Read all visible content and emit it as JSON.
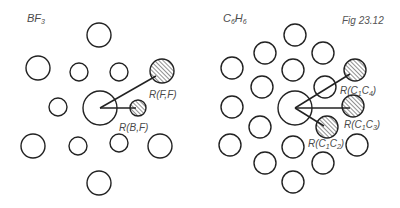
{
  "figure": {
    "label": "Fig 23.12",
    "stroke_color": "#222222",
    "hatch_color": "#333333"
  },
  "panels": [
    {
      "id": "bf3",
      "title_main": "BF",
      "title_sub": "3",
      "center": {
        "x": 100,
        "y": 108,
        "r": 17
      },
      "atoms": [
        {
          "x": 99,
          "y": 35,
          "r": 12,
          "hatched": false
        },
        {
          "x": 38,
          "y": 68,
          "r": 12,
          "hatched": false
        },
        {
          "x": 79,
          "y": 72,
          "r": 9,
          "hatched": false
        },
        {
          "x": 119,
          "y": 72,
          "r": 9,
          "hatched": false
        },
        {
          "x": 162,
          "y": 71,
          "r": 12,
          "hatched": true
        },
        {
          "x": 58,
          "y": 107,
          "r": 9,
          "hatched": false
        },
        {
          "x": 138,
          "y": 108,
          "r": 8,
          "hatched": true
        },
        {
          "x": 33,
          "y": 146,
          "r": 12,
          "hatched": false
        },
        {
          "x": 78,
          "y": 146,
          "r": 9,
          "hatched": false
        },
        {
          "x": 119,
          "y": 143,
          "r": 9,
          "hatched": false
        },
        {
          "x": 160,
          "y": 146,
          "r": 12,
          "hatched": false
        },
        {
          "x": 99,
          "y": 183,
          "r": 12,
          "hatched": false
        }
      ],
      "vectors": [
        {
          "x2": 156,
          "y2": 76,
          "label": "R(F,F)"
        },
        {
          "x2": 136,
          "y2": 108,
          "label": "R(B,F)"
        }
      ],
      "labels": [
        {
          "text": "R(F,F)",
          "x": 149,
          "y": 90
        },
        {
          "text": "R(B,F)",
          "x": 119,
          "y": 123
        }
      ]
    },
    {
      "id": "c6h6",
      "title_parts": [
        "C",
        "6",
        "H",
        "6"
      ],
      "center": {
        "x": 295,
        "y": 108,
        "r": 17
      },
      "atoms": [
        {
          "x": 295,
          "y": 35,
          "r": 11,
          "hatched": false
        },
        {
          "x": 265,
          "y": 53,
          "r": 11,
          "hatched": false
        },
        {
          "x": 323,
          "y": 53,
          "r": 11,
          "hatched": false
        },
        {
          "x": 232,
          "y": 68,
          "r": 11,
          "hatched": false
        },
        {
          "x": 293,
          "y": 70,
          "r": 11,
          "hatched": false
        },
        {
          "x": 355,
          "y": 70,
          "r": 11,
          "hatched": true
        },
        {
          "x": 262,
          "y": 87,
          "r": 11,
          "hatched": false
        },
        {
          "x": 325,
          "y": 87,
          "r": 11,
          "hatched": false
        },
        {
          "x": 232,
          "y": 107,
          "r": 11,
          "hatched": false
        },
        {
          "x": 353,
          "y": 106,
          "r": 11,
          "hatched": true
        },
        {
          "x": 260,
          "y": 127,
          "r": 11,
          "hatched": false
        },
        {
          "x": 327,
          "y": 127,
          "r": 11,
          "hatched": true
        },
        {
          "x": 230,
          "y": 145,
          "r": 11,
          "hatched": false
        },
        {
          "x": 293,
          "y": 147,
          "r": 11,
          "hatched": false
        },
        {
          "x": 357,
          "y": 145,
          "r": 11,
          "hatched": false
        },
        {
          "x": 265,
          "y": 163,
          "r": 11,
          "hatched": false
        },
        {
          "x": 323,
          "y": 163,
          "r": 11,
          "hatched": false
        },
        {
          "x": 293,
          "y": 182,
          "r": 11,
          "hatched": false
        }
      ],
      "vectors": [
        {
          "x2": 350,
          "y2": 74,
          "label": "R(C1C4)"
        },
        {
          "x2": 350,
          "y2": 108,
          "label": "R(C1C3)"
        },
        {
          "x2": 324,
          "y2": 126,
          "label": "R(C1C2)"
        }
      ],
      "labels": [
        {
          "main": "R(C",
          "s1": "1",
          "mid": "C",
          "s2": "4",
          "end": ")",
          "x": 340,
          "y": 86
        },
        {
          "main": "R(C",
          "s1": "1",
          "mid": "C",
          "s2": "3",
          "end": ")",
          "x": 344,
          "y": 120
        },
        {
          "main": "R(C",
          "s1": "1",
          "mid": "C",
          "s2": "2",
          "end": ")",
          "x": 308,
          "y": 139
        }
      ]
    }
  ]
}
